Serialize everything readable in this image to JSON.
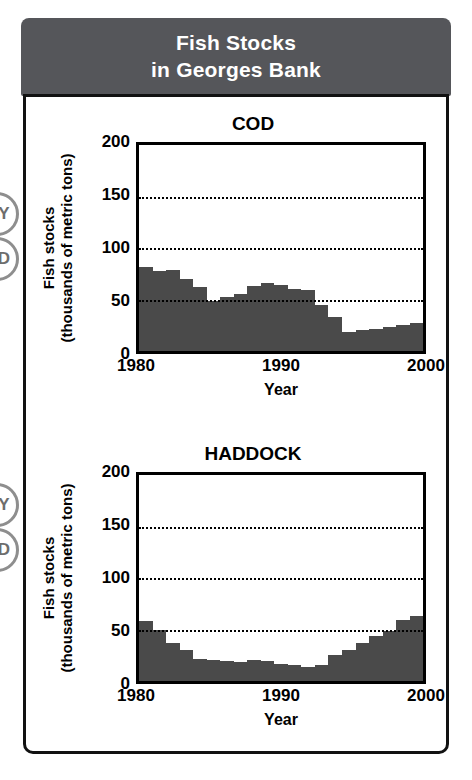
{
  "header": {
    "line1": "Fish Stocks",
    "line2": "in Georges Bank"
  },
  "edge_badges": [
    {
      "label": "Y"
    },
    {
      "label": "D"
    },
    {
      "label": "Y"
    },
    {
      "label": "D"
    }
  ],
  "chart_data": [
    {
      "type": "bar",
      "title": "COD",
      "xlabel": "Year",
      "ylabel_line1": "Fish stocks",
      "ylabel_line2": "(thousands of metric tons)",
      "ylim": [
        0,
        200
      ],
      "yticks": [
        0,
        50,
        100,
        150,
        200
      ],
      "ytick_labels": [
        "0",
        "50",
        "100",
        "150",
        "200"
      ],
      "gridlines": [
        50,
        100,
        150
      ],
      "grid": true,
      "legend": "none",
      "xlim": [
        1980,
        2000
      ],
      "xticks": [
        1980,
        1990,
        2000
      ],
      "xtick_labels": [
        "1980",
        "1990",
        "2000"
      ],
      "categories": [
        1980,
        1981,
        1982,
        1983,
        1984,
        1985,
        1986,
        1987,
        1988,
        1989,
        1990,
        1991,
        1992,
        1993,
        1994,
        1995,
        1996,
        1997,
        1998,
        1999,
        2000
      ],
      "values": [
        82,
        78,
        79,
        70,
        62,
        49,
        52,
        55,
        63,
        66,
        64,
        60,
        59,
        45,
        33,
        18,
        20,
        21,
        23,
        25,
        27
      ],
      "bar_color": "#4a4a4a"
    },
    {
      "type": "bar",
      "title": "HADDOCK",
      "xlabel": "Year",
      "ylabel_line1": "Fish stocks",
      "ylabel_line2": "(thousands of metric tons)",
      "ylim": [
        0,
        200
      ],
      "yticks": [
        0,
        50,
        100,
        150,
        200
      ],
      "ytick_labels": [
        "0",
        "50",
        "100",
        "150",
        "200"
      ],
      "gridlines": [
        50,
        100,
        150
      ],
      "grid": true,
      "legend": "none",
      "xlim": [
        1980,
        2000
      ],
      "xticks": [
        1980,
        1990,
        2000
      ],
      "xtick_labels": [
        "1980",
        "1990",
        "2000"
      ],
      "categories": [
        1980,
        1981,
        1982,
        1983,
        1984,
        1985,
        1986,
        1987,
        1988,
        1989,
        1990,
        1991,
        1992,
        1993,
        1994,
        1995,
        1996,
        1997,
        1998,
        1999,
        2000
      ],
      "values": [
        58,
        50,
        37,
        30,
        21,
        20,
        19,
        18,
        20,
        19,
        17,
        16,
        14,
        16,
        25,
        30,
        37,
        44,
        49,
        59,
        63
      ],
      "bar_color": "#4a4a4a"
    }
  ]
}
